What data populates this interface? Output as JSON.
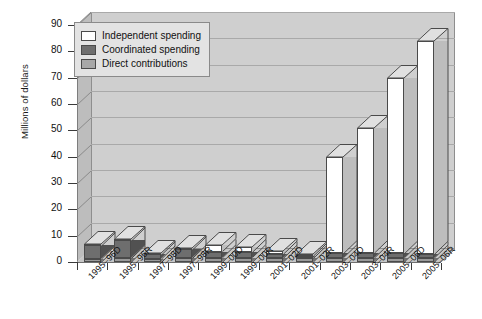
{
  "chart_data": {
    "type": "bar",
    "subtype": "stacked-3d-column",
    "title": "",
    "xlabel": "",
    "ylabel": "Millions of dollars",
    "ylim": [
      0,
      90
    ],
    "yticks": [
      0,
      10,
      20,
      30,
      40,
      50,
      60,
      70,
      80,
      90
    ],
    "grid": true,
    "legend_position": "top-left",
    "categories": [
      "1995–96D",
      "1995–96R",
      "1997–98D",
      "1997–98R",
      "1999–00D",
      "1999–00R",
      "2001–02D",
      "2001–02R",
      "2003–04D",
      "2003–04R",
      "2005–06D",
      "2005–06R"
    ],
    "series": [
      {
        "name": "Direct contributions",
        "color": "#9a9a9a",
        "values": [
          1.2,
          1.5,
          1.3,
          1.5,
          1.6,
          1.6,
          1.5,
          1.5,
          1.5,
          1.6,
          1.5,
          1.5
        ]
      },
      {
        "name": "Coordinated spending",
        "color": "#6e6e6e",
        "values": [
          5.3,
          7.0,
          1.9,
          3.6,
          2.2,
          2.1,
          1.6,
          0.9,
          1.8,
          1.9,
          1.8,
          1.5
        ]
      },
      {
        "name": "Independent spending",
        "color": "#ffffff",
        "values": [
          0.3,
          0.3,
          0.3,
          0.3,
          2.5,
          2.0,
          1.2,
          0.8,
          36.7,
          47.5,
          66.7,
          81.0
        ]
      }
    ],
    "totals": [
      6.8,
      8.8,
      3.5,
      5.4,
      6.3,
      5.7,
      4.3,
      3.2,
      40.0,
      51.0,
      70.0,
      84.0
    ]
  },
  "legend": {
    "items": [
      {
        "label": "Independent spending",
        "color": "#ffffff"
      },
      {
        "label": "Coordinated spending",
        "color": "#6e6e6e"
      },
      {
        "label": "Direct contributions",
        "color": "#a8a8a8"
      }
    ]
  },
  "axes": {
    "y_title": "Millions of dollars",
    "y_tick_labels": [
      "0",
      "10",
      "20",
      "30",
      "40",
      "50",
      "60",
      "70",
      "80",
      "90"
    ],
    "x_tick_labels": [
      "1995–96D",
      "1995–96R",
      "1997–98D",
      "1997–98R",
      "1999–00D",
      "1999–00R",
      "2001–02D",
      "2001–02R",
      "2003–04D",
      "2003–04R",
      "2005–06D",
      "2005–06R"
    ]
  },
  "colors": {
    "plot_background": "#cfcfcf",
    "floor": "#c6c6c6",
    "gridline": "#a9a9a9",
    "outline": "#4a4a4a",
    "legend_background": "#e3e3e3"
  }
}
